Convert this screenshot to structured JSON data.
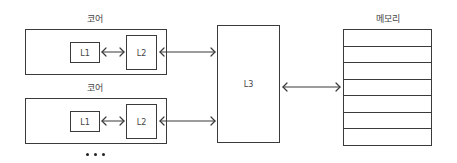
{
  "diagram": {
    "cores": [
      {
        "title": "코어",
        "l1_label": "L1",
        "l2_label": "L2"
      },
      {
        "title": "코어",
        "l1_label": "L1",
        "l2_label": "L2"
      }
    ],
    "ellipsis": "• • •",
    "l3": {
      "label": "L3"
    },
    "memory": {
      "title": "메모리",
      "rows": 7
    },
    "connections": [
      {
        "from": "core1.L1",
        "to": "core1.L2",
        "type": "bidirectional"
      },
      {
        "from": "core1.L2",
        "to": "L3",
        "type": "bidirectional"
      },
      {
        "from": "core2.L1",
        "to": "core2.L2",
        "type": "bidirectional"
      },
      {
        "from": "core2.L2",
        "to": "L3",
        "type": "bidirectional"
      },
      {
        "from": "L3",
        "to": "memory",
        "type": "bidirectional"
      }
    ],
    "colors": {
      "stroke": "#3a3a3a",
      "background": "#ffffff",
      "text": "#444444"
    }
  }
}
